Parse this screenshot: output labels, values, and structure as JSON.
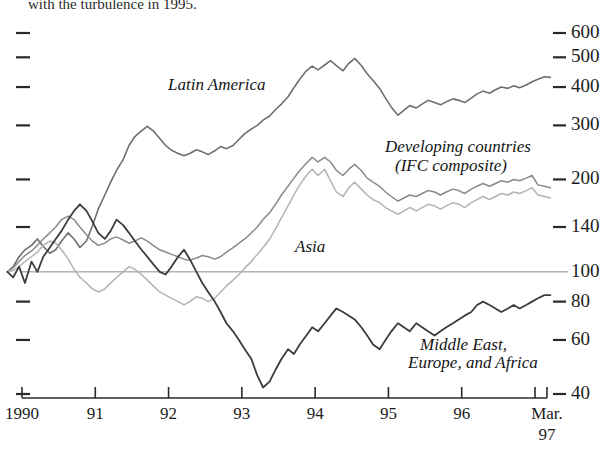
{
  "page": {
    "caption_fragment": "with the turbulence in 1995."
  },
  "chart_data": {
    "type": "line",
    "title": "",
    "subtitle": "",
    "xlabel": "",
    "ylabel": "",
    "scale": "log",
    "grid": false,
    "legend_position": "inline-annotations",
    "baseline_value": 100,
    "ylim": [
      40,
      700
    ],
    "yticks": [
      600,
      500,
      400,
      300,
      200,
      140,
      100,
      80,
      60,
      40
    ],
    "ytick_labels": [
      "600",
      "500",
      "400",
      "300",
      "200",
      "140",
      "100",
      "80",
      "60",
      "40"
    ],
    "xlim": [
      1989.75,
      1997.25
    ],
    "xticks": [
      1990,
      1991,
      1992,
      1993,
      1994,
      1995,
      1996,
      1997
    ],
    "xtick_labels": [
      "1990",
      "91",
      "92",
      "93",
      "94",
      "95",
      "96",
      "Mar. 97"
    ],
    "x_end_label_line1": "Mar.",
    "x_end_label_line2": "97",
    "annotations": [
      {
        "text": "Latin America",
        "x": 1990.95,
        "y": 330
      },
      {
        "text": "Developing countries",
        "x": 1995.15,
        "y": 245
      },
      {
        "text": "(IFC composite)",
        "x": 1995.15,
        "y": 218
      },
      {
        "text": "Asia",
        "x": 1993.0,
        "y": 118
      },
      {
        "text": "Middle East,",
        "x": 1995.85,
        "y": 70
      },
      {
        "text": "Europe, and Africa",
        "x": 1995.85,
        "y": 63
      }
    ],
    "series": [
      {
        "name": "Latin America",
        "color": "#6f6f6f",
        "width": 1.6,
        "x": [
          1989.8,
          1989.88,
          1989.96,
          1990.04,
          1990.13,
          1990.21,
          1990.29,
          1990.38,
          1990.46,
          1990.54,
          1990.63,
          1990.71,
          1990.79,
          1990.88,
          1990.96,
          1991.04,
          1991.13,
          1991.21,
          1991.29,
          1991.38,
          1991.46,
          1991.54,
          1991.63,
          1991.71,
          1991.79,
          1991.88,
          1991.96,
          1992.04,
          1992.13,
          1992.21,
          1992.29,
          1992.38,
          1992.46,
          1992.54,
          1992.63,
          1992.71,
          1992.79,
          1992.88,
          1992.96,
          1993.04,
          1993.13,
          1993.21,
          1993.29,
          1993.38,
          1993.46,
          1993.54,
          1993.63,
          1993.71,
          1993.79,
          1993.88,
          1993.96,
          1994.04,
          1994.13,
          1994.21,
          1994.29,
          1994.38,
          1994.46,
          1994.54,
          1994.63,
          1994.71,
          1994.79,
          1994.88,
          1994.96,
          1995.04,
          1995.13,
          1995.21,
          1995.29,
          1995.38,
          1995.46,
          1995.54,
          1995.63,
          1995.71,
          1995.79,
          1995.88,
          1995.96,
          1996.04,
          1996.13,
          1996.21,
          1996.29,
          1996.38,
          1996.46,
          1996.54,
          1996.63,
          1996.71,
          1996.79,
          1996.88,
          1996.96,
          1997.04,
          1997.13,
          1997.21
        ],
        "values": [
          100,
          104,
          112,
          118,
          122,
          128,
          121,
          115,
          118,
          126,
          134,
          128,
          120,
          126,
          141,
          160,
          178,
          196,
          214,
          232,
          258,
          276,
          288,
          298,
          288,
          272,
          258,
          249,
          243,
          239,
          243,
          250,
          246,
          241,
          248,
          256,
          252,
          258,
          270,
          282,
          292,
          300,
          312,
          322,
          338,
          352,
          372,
          398,
          424,
          452,
          468,
          455,
          472,
          488,
          470,
          452,
          478,
          496,
          470,
          442,
          420,
          396,
          368,
          344,
          324,
          336,
          348,
          342,
          352,
          362,
          356,
          350,
          358,
          366,
          362,
          356,
          368,
          380,
          388,
          382,
          392,
          400,
          396,
          404,
          398,
          406,
          416,
          424,
          432,
          430
        ]
      },
      {
        "name": "Developing countries (IFC composite)",
        "color": "#8a8a8a",
        "width": 1.5,
        "x": [
          1989.8,
          1989.88,
          1989.96,
          1990.04,
          1990.13,
          1990.21,
          1990.29,
          1990.38,
          1990.46,
          1990.54,
          1990.63,
          1990.71,
          1990.79,
          1990.88,
          1990.96,
          1991.04,
          1991.13,
          1991.21,
          1991.29,
          1991.38,
          1991.46,
          1991.54,
          1991.63,
          1991.71,
          1991.79,
          1991.88,
          1991.96,
          1992.04,
          1992.13,
          1992.21,
          1992.29,
          1992.38,
          1992.46,
          1992.54,
          1992.63,
          1992.71,
          1992.79,
          1992.88,
          1992.96,
          1993.04,
          1993.13,
          1993.21,
          1993.29,
          1993.38,
          1993.46,
          1993.54,
          1993.63,
          1993.71,
          1993.79,
          1993.88,
          1993.96,
          1994.04,
          1994.13,
          1994.21,
          1994.29,
          1994.38,
          1994.46,
          1994.54,
          1994.63,
          1994.71,
          1994.79,
          1994.88,
          1994.96,
          1995.04,
          1995.13,
          1995.21,
          1995.29,
          1995.38,
          1995.46,
          1995.54,
          1995.63,
          1995.71,
          1995.79,
          1995.88,
          1995.96,
          1996.04,
          1996.13,
          1996.21,
          1996.29,
          1996.38,
          1996.46,
          1996.54,
          1996.63,
          1996.71,
          1996.79,
          1996.88,
          1996.96,
          1997.04,
          1997.13,
          1997.21
        ],
        "values": [
          100,
          103,
          108,
          113,
          117,
          122,
          128,
          134,
          140,
          148,
          152,
          148,
          140,
          132,
          126,
          122,
          124,
          128,
          130,
          127,
          124,
          126,
          129,
          126,
          122,
          118,
          116,
          114,
          112,
          110,
          109,
          111,
          113,
          112,
          110,
          112,
          116,
          120,
          124,
          128,
          134,
          140,
          148,
          156,
          166,
          178,
          190,
          202,
          214,
          226,
          236,
          228,
          236,
          228,
          214,
          206,
          216,
          224,
          214,
          202,
          196,
          190,
          182,
          176,
          170,
          174,
          178,
          176,
          180,
          184,
          182,
          178,
          182,
          186,
          184,
          180,
          186,
          190,
          194,
          190,
          194,
          198,
          196,
          200,
          198,
          202,
          206,
          192,
          190,
          188
        ]
      },
      {
        "name": "Asia",
        "color": "#b3b3b3",
        "width": 1.5,
        "x": [
          1989.8,
          1989.88,
          1989.96,
          1990.04,
          1990.13,
          1990.21,
          1990.29,
          1990.38,
          1990.46,
          1990.54,
          1990.63,
          1990.71,
          1990.79,
          1990.88,
          1990.96,
          1991.04,
          1991.13,
          1991.21,
          1991.29,
          1991.38,
          1991.46,
          1991.54,
          1991.63,
          1991.71,
          1991.79,
          1991.88,
          1991.96,
          1992.04,
          1992.13,
          1992.21,
          1992.29,
          1992.38,
          1992.46,
          1992.54,
          1992.63,
          1992.71,
          1992.79,
          1992.88,
          1992.96,
          1993.04,
          1993.13,
          1993.21,
          1993.29,
          1993.38,
          1993.46,
          1993.54,
          1993.63,
          1993.71,
          1993.79,
          1993.88,
          1993.96,
          1994.04,
          1994.13,
          1994.21,
          1994.29,
          1994.38,
          1994.46,
          1994.54,
          1994.63,
          1994.71,
          1994.79,
          1994.88,
          1994.96,
          1995.04,
          1995.13,
          1995.21,
          1995.29,
          1995.38,
          1995.46,
          1995.54,
          1995.63,
          1995.71,
          1995.79,
          1995.88,
          1995.96,
          1996.04,
          1996.13,
          1996.21,
          1996.29,
          1996.38,
          1996.46,
          1996.54,
          1996.63,
          1996.71,
          1996.79,
          1996.88,
          1996.96,
          1997.04,
          1997.13,
          1997.21
        ],
        "values": [
          100,
          101,
          104,
          108,
          112,
          116,
          122,
          126,
          124,
          118,
          110,
          102,
          96,
          92,
          88,
          86,
          88,
          92,
          96,
          100,
          104,
          102,
          98,
          94,
          90,
          86,
          84,
          82,
          80,
          78,
          80,
          83,
          82,
          80,
          82,
          86,
          90,
          94,
          98,
          103,
          108,
          114,
          120,
          128,
          138,
          150,
          164,
          178,
          192,
          206,
          216,
          206,
          216,
          198,
          182,
          176,
          188,
          196,
          186,
          178,
          172,
          168,
          162,
          158,
          154,
          158,
          162,
          158,
          162,
          166,
          164,
          160,
          164,
          168,
          166,
          162,
          168,
          172,
          176,
          172,
          176,
          180,
          178,
          182,
          180,
          184,
          188,
          178,
          176,
          174
        ]
      },
      {
        "name": "Middle East, Europe, and Africa",
        "color": "#3c3c3c",
        "width": 1.8,
        "x": [
          1989.8,
          1989.88,
          1989.96,
          1990.04,
          1990.13,
          1990.21,
          1990.29,
          1990.38,
          1990.46,
          1990.54,
          1990.63,
          1990.71,
          1990.79,
          1990.88,
          1990.96,
          1991.04,
          1991.13,
          1991.21,
          1991.29,
          1991.38,
          1991.46,
          1991.54,
          1991.63,
          1991.71,
          1991.79,
          1991.88,
          1991.96,
          1992.04,
          1992.13,
          1992.21,
          1992.29,
          1992.38,
          1992.46,
          1992.54,
          1992.63,
          1992.71,
          1992.79,
          1992.88,
          1992.96,
          1993.04,
          1993.13,
          1993.21,
          1993.29,
          1993.38,
          1993.46,
          1993.54,
          1993.63,
          1993.71,
          1993.79,
          1993.88,
          1993.96,
          1994.04,
          1994.13,
          1994.21,
          1994.29,
          1994.38,
          1994.46,
          1994.54,
          1994.63,
          1994.71,
          1994.79,
          1994.88,
          1994.96,
          1995.04,
          1995.13,
          1995.21,
          1995.29,
          1995.38,
          1995.46,
          1995.54,
          1995.63,
          1995.71,
          1995.79,
          1995.88,
          1995.96,
          1996.04,
          1996.13,
          1996.21,
          1996.29,
          1996.38,
          1996.46,
          1996.54,
          1996.63,
          1996.71,
          1996.79,
          1996.88,
          1996.96,
          1997.04,
          1997.13,
          1997.21
        ],
        "values": [
          100,
          96,
          104,
          92,
          108,
          100,
          112,
          120,
          128,
          136,
          148,
          158,
          166,
          158,
          146,
          134,
          128,
          136,
          148,
          142,
          134,
          126,
          118,
          112,
          106,
          100,
          98,
          104,
          112,
          118,
          110,
          100,
          92,
          86,
          80,
          74,
          68,
          64,
          60,
          56,
          52,
          46,
          42,
          44,
          48,
          52,
          56,
          54,
          58,
          62,
          66,
          64,
          68,
          72,
          76,
          74,
          72,
          70,
          66,
          62,
          58,
          56,
          60,
          64,
          68,
          66,
          64,
          68,
          66,
          64,
          62,
          64,
          66,
          68,
          70,
          72,
          74,
          78,
          80,
          78,
          76,
          74,
          76,
          78,
          76,
          78,
          80,
          82,
          84,
          84
        ]
      }
    ]
  }
}
